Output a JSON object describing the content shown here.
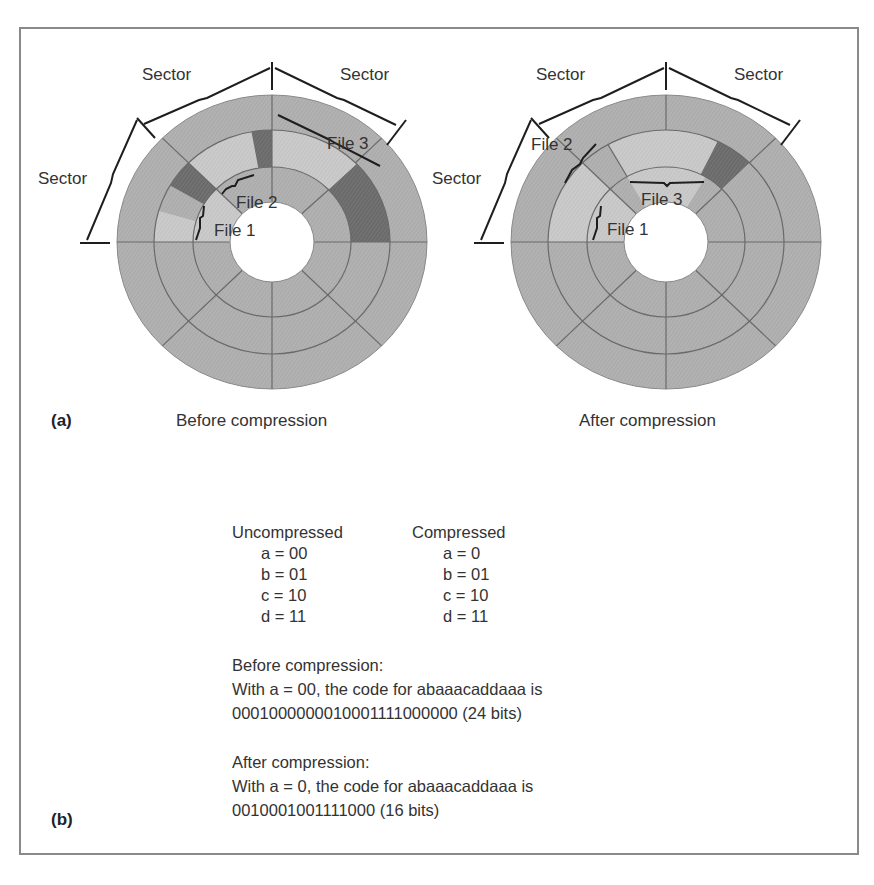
{
  "figure": {
    "panel_a_label": "(a)",
    "panel_b_label": "(b)",
    "colors": {
      "border": "#8a8a8a",
      "sector_gray": "#b2b2b2",
      "file_light": "#cacaca",
      "used_dark": "#6e6e6e",
      "hole": "#ffffff",
      "line": "#6a6a6a",
      "text": "#333333"
    }
  },
  "disk_before": {
    "caption": "Before compression",
    "sector_labels": [
      "Sector",
      "Sector",
      "Sector"
    ],
    "file_labels": [
      "File 1",
      "File 2",
      "File 3"
    ]
  },
  "disk_after": {
    "caption": "After compression",
    "sector_labels": [
      "Sector",
      "Sector",
      "Sector"
    ],
    "file_labels": [
      "File 1",
      "File 2",
      "File 3"
    ]
  },
  "encoding_table": {
    "uncompressed_header": "Uncompressed",
    "compressed_header": "Compressed",
    "uncompressed_rows": [
      "a = 00",
      "b = 01",
      "c = 10",
      "d = 11"
    ],
    "compressed_rows": [
      "a = 0",
      "b = 01",
      "c = 10",
      "d = 11"
    ]
  },
  "before_text": {
    "heading": "Before compression:",
    "line": "With a = 00, the code for abaaacaddaaa is",
    "code": "0001000000010001111000000 (24 bits)"
  },
  "after_text": {
    "heading": "After compression:",
    "line": "With a = 0, the code for abaaacaddaaa is",
    "code": "0010001001111000 (16 bits)"
  }
}
